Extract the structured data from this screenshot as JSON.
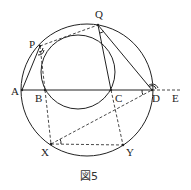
{
  "figure": {
    "caption": "図5",
    "points": {
      "A": {
        "label": "A",
        "x": 22,
        "y": 90
      },
      "B": {
        "label": "B",
        "x": 45,
        "y": 90
      },
      "C": {
        "label": "C",
        "x": 111,
        "y": 90
      },
      "D": {
        "label": "D",
        "x": 152,
        "y": 90
      },
      "E": {
        "label": "E",
        "x": 180,
        "y": 90
      },
      "P": {
        "label": "P",
        "x": 40,
        "y": 46
      },
      "Q": {
        "label": "Q",
        "x": 98,
        "y": 25
      },
      "X": {
        "label": "X",
        "x": 51,
        "y": 144
      },
      "Y": {
        "label": "Y",
        "x": 123,
        "y": 145
      }
    },
    "large_circle": {
      "cx": 87,
      "cy": 90,
      "r": 66
    },
    "small_circle": {
      "cx": 78,
      "cy": 72,
      "r": 37
    }
  }
}
